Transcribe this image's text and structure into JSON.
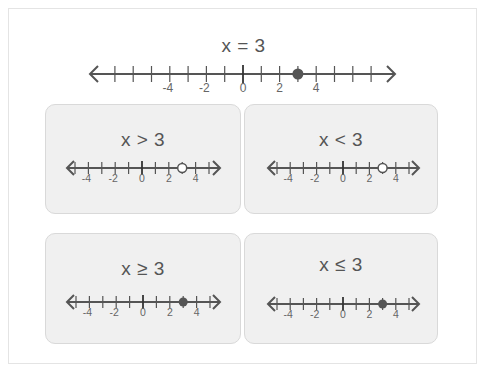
{
  "main": {
    "title": "x = 3",
    "number_line": {
      "min": -7,
      "max": 7,
      "labels": [
        -4,
        -2,
        0,
        2,
        4
      ],
      "point": 3,
      "point_type": "closed"
    }
  },
  "panels": [
    {
      "title": "x > 3",
      "number_line": {
        "min": -5,
        "max": 5,
        "labels": [
          -4,
          -2,
          0,
          2,
          4
        ],
        "point": 3,
        "point_type": "open"
      }
    },
    {
      "title": "x < 3",
      "number_line": {
        "min": -5,
        "max": 5,
        "labels": [
          -4,
          -2,
          0,
          2,
          4
        ],
        "point": 3,
        "point_type": "open"
      }
    },
    {
      "title": "x ≥ 3",
      "number_line": {
        "min": -5,
        "max": 5,
        "labels": [
          -4,
          -2,
          0,
          2,
          4
        ],
        "point": 3,
        "point_type": "closed"
      }
    },
    {
      "title": "x ≤ 3",
      "number_line": {
        "min": -5,
        "max": 5,
        "labels": [
          -4,
          -2,
          0,
          2,
          4
        ],
        "point": 3,
        "point_type": "closed"
      }
    }
  ],
  "colors": {
    "line": "#555555",
    "point": "#555555",
    "open_fill": "#ffffff",
    "panel_bg": "#f0f0f0"
  }
}
